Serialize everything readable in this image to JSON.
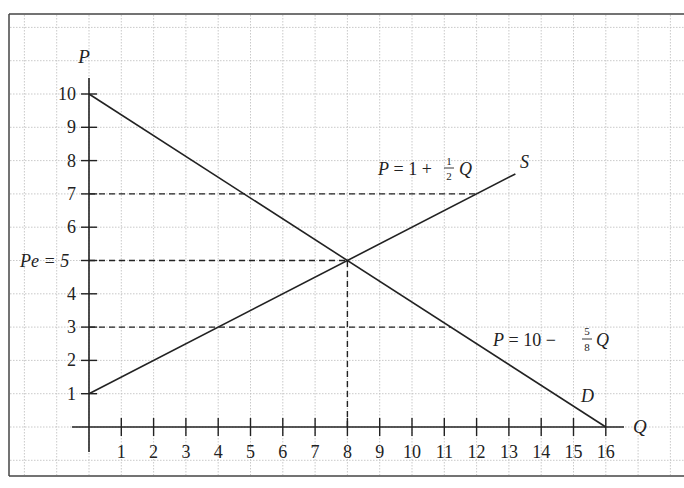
{
  "chart_data": {
    "type": "line",
    "title": "",
    "xlabel": "Q",
    "ylabel": "P",
    "xlim": [
      0,
      16
    ],
    "ylim": [
      0,
      10
    ],
    "grid": true,
    "x_ticks": [
      1,
      2,
      3,
      4,
      5,
      6,
      7,
      8,
      9,
      10,
      11,
      12,
      13,
      14,
      15,
      16
    ],
    "y_ticks": [
      1,
      2,
      3,
      4,
      5,
      6,
      7,
      8,
      9,
      10
    ],
    "series": [
      {
        "name": "S",
        "equation": "P = 1 + 1/2 Q",
        "points": [
          [
            0,
            1
          ],
          [
            13.2,
            7.6
          ]
        ]
      },
      {
        "name": "D",
        "equation": "P = 10 - 5/8 Q",
        "points": [
          [
            0,
            10
          ],
          [
            16,
            0
          ]
        ]
      }
    ],
    "reference_lines": [
      {
        "type": "horizontal",
        "y": 7,
        "x_from": 0,
        "x_to": 12,
        "style": "dashed"
      },
      {
        "type": "horizontal",
        "y": 5,
        "x_from": 0,
        "x_to": 8,
        "style": "dashed"
      },
      {
        "type": "vertical",
        "x": 8,
        "y_from": 0,
        "y_to": 5,
        "style": "dashed"
      },
      {
        "type": "horizontal",
        "y": 3,
        "x_from": 0,
        "x_to": 11.2,
        "style": "dashed"
      }
    ],
    "annotations": [
      {
        "text": "Pe = 5",
        "at": "y-axis, P=5"
      },
      {
        "text": "S",
        "at": "end of supply line"
      },
      {
        "text": "D",
        "at": "near demand line, Q≈15"
      },
      {
        "text": "P = 1 + 1/2 Q",
        "at": "above supply line"
      },
      {
        "text": "P = 10 - 5/8 Q",
        "at": "right of demand line, P≈3"
      }
    ],
    "equilibrium": {
      "Q": 8,
      "P": 5
    }
  },
  "labels": {
    "axis_p": "P",
    "axis_q": "Q",
    "pe_label": "Pe = 5",
    "supply_label": "S",
    "demand_label": "D",
    "supply_eq_lhs": "P = 1 + ",
    "supply_eq_num": "1",
    "supply_eq_den": "2",
    "supply_eq_var": "Q",
    "demand_eq_lhs": "P = 10 − ",
    "demand_eq_num": "5",
    "demand_eq_den": "8",
    "demand_eq_var": "Q",
    "y_ticks": [
      "1",
      "2",
      "3",
      "4",
      "5",
      "6",
      "7",
      "8",
      "9",
      "10"
    ],
    "x_ticks": [
      "1",
      "2",
      "3",
      "4",
      "5",
      "6",
      "7",
      "8",
      "9",
      "10",
      "11",
      "12",
      "13",
      "14",
      "15",
      "16"
    ]
  }
}
